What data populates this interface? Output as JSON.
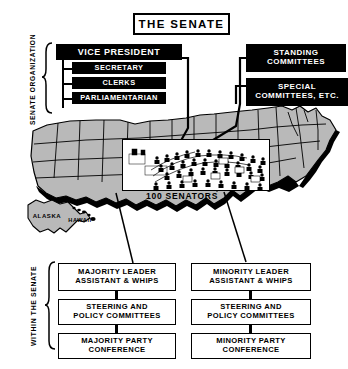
{
  "title": {
    "text": "THE SENATE"
  },
  "side_labels": {
    "organization": "SENATE ORGANIZATION",
    "within": "WITHIN THE SENATE"
  },
  "organization": {
    "head": "VICE PRESIDENT",
    "officers": [
      {
        "label": "SECRETARY"
      },
      {
        "label": "CLERKS"
      },
      {
        "label": "PARLIAMENTARIAN"
      }
    ]
  },
  "committees": [
    {
      "label": "STANDING\nCOMMITTEES",
      "line1": "STANDING",
      "line2": "COMMITTEES"
    },
    {
      "label": "SPECIAL COMMITTEES, ETC.",
      "line1": "SPECIAL",
      "line2": "COMMITTEES, ETC."
    }
  ],
  "map": {
    "inset_caption": "100 SENATORS",
    "states_label_alaska": "ALASKA",
    "states_label_hawaii": "HAWAII",
    "fill_color": "#b9b9b9",
    "stroke_color": "#000000"
  },
  "parties": {
    "majority": [
      {
        "line1": "MAJORITY LEADER",
        "line2": "ASSISTANT & WHIPS"
      },
      {
        "line1": "STEERING AND",
        "line2": "POLICY COMMITTEES"
      },
      {
        "line1": "MAJORITY PARTY",
        "line2": "CONFERENCE"
      }
    ],
    "minority": [
      {
        "line1": "MINORITY LEADER",
        "line2": "ASSISTANT & WHIPS"
      },
      {
        "line1": "STEERING AND",
        "line2": "POLICY COMMITTEES"
      },
      {
        "line1": "MINORITY PARTY",
        "line2": "CONFERENCE"
      }
    ]
  }
}
